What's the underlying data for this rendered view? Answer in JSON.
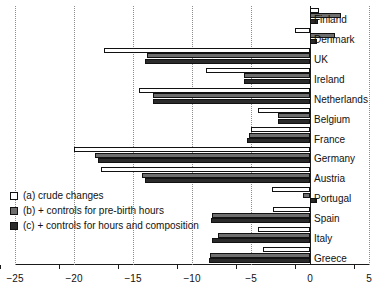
{
  "chart_data": {
    "type": "bar",
    "orientation": "horizontal",
    "title": "",
    "xlabel": "",
    "ylabel": "",
    "xlim": [
      -25,
      5
    ],
    "xticks": [
      -25,
      -20,
      -15,
      -10,
      -5,
      0,
      5
    ],
    "xticklabels": [
      "−25",
      "−20",
      "−15",
      "−10",
      "−5",
      "0",
      "5"
    ],
    "grid": "vertical dotted gridlines at each x tick",
    "legend_position": "lower-left inside axes",
    "categories": [
      "Finland",
      "Denmark",
      "UK",
      "Ireland",
      "Netherlands",
      "Belgium",
      "France",
      "Germany",
      "Austria",
      "Portugal",
      "Spain",
      "Italy",
      "Greece"
    ],
    "series": [
      {
        "name": "(a) crude changes",
        "key": "a",
        "color": "#ffffff",
        "values": [
          0.8,
          -1.3,
          -17.5,
          -8.8,
          -14.5,
          -4.4,
          -5.0,
          -20.0,
          -17.7,
          -3.2,
          -3.1,
          -4.4,
          -4.0
        ]
      },
      {
        "name": "(b) + controls for pre-birth hours",
        "key": "b",
        "color": "#6e6e6e",
        "values": [
          2.6,
          2.1,
          -13.8,
          -5.6,
          -13.3,
          -2.7,
          -5.2,
          -18.2,
          -14.2,
          -0.6,
          -8.3,
          -7.8,
          -8.5
        ]
      },
      {
        "name": "(c) + controls for hours and composition",
        "key": "c",
        "color": "#2b2b2b",
        "values": [
          0.7,
          0.6,
          -14.0,
          -5.6,
          -13.3,
          -2.7,
          -5.3,
          -18.0,
          -14.0,
          0.6,
          -8.4,
          -8.3,
          -8.6
        ]
      }
    ]
  },
  "legend": {
    "items": [
      {
        "label": "(a) crude changes",
        "key": "a"
      },
      {
        "label": "(b) + controls for pre-birth hours",
        "key": "b"
      },
      {
        "label": "(c) + controls for hours and composition",
        "key": "c"
      }
    ]
  }
}
